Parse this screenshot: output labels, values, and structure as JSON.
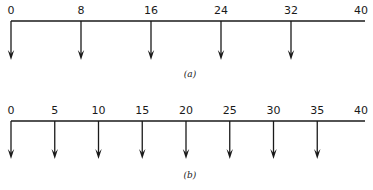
{
  "diagrams": [
    {
      "id": "a",
      "caption": "(a)",
      "axis": {
        "start": 0,
        "end": 40
      },
      "labels": [
        "0",
        "8",
        "16",
        "24",
        "32",
        "40"
      ],
      "label_values": [
        0,
        8,
        16,
        24,
        32,
        40
      ],
      "arrow_positions": [
        0,
        8,
        16,
        24,
        32
      ]
    },
    {
      "id": "b",
      "caption": "(b)",
      "axis": {
        "start": 0,
        "end": 40
      },
      "labels": [
        "0",
        "5",
        "10",
        "15",
        "20",
        "25",
        "30",
        "35",
        "40"
      ],
      "label_values": [
        0,
        5,
        10,
        15,
        20,
        25,
        30,
        35,
        40
      ],
      "arrow_positions": [
        0,
        5,
        10,
        15,
        20,
        25,
        30,
        35
      ]
    }
  ]
}
